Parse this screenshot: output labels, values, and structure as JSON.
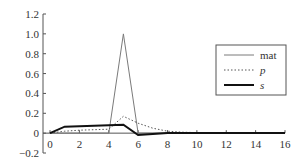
{
  "chart_data": {
    "type": "line",
    "title": "",
    "xlabel": "",
    "ylabel": "",
    "xlim": [
      0,
      16
    ],
    "ylim": [
      -0.2,
      1.2
    ],
    "grid": false,
    "legend_position": "upper right",
    "x_ticks": [
      0,
      2,
      4,
      6,
      8,
      10,
      12,
      14,
      16
    ],
    "x_tick_labels": [
      "0",
      "2",
      "4",
      "6",
      "8",
      "10",
      "12",
      "14",
      "16"
    ],
    "y_ticks": [
      -0.2,
      0,
      0.2,
      0.4,
      0.6,
      0.8,
      1.0,
      1.2
    ],
    "y_tick_labels": [
      "−0.2",
      "0",
      "0.2",
      "0.4",
      "0.6",
      "0.8",
      "1.0",
      "1.2"
    ],
    "x": [
      0,
      1,
      2,
      3,
      4,
      5,
      6,
      7,
      8,
      9,
      10,
      11,
      12,
      13,
      14,
      15,
      16
    ],
    "series": [
      {
        "name": "mat",
        "style": "solid-thin",
        "color": "#7a7a7a",
        "values": [
          0,
          0,
          0,
          0,
          0,
          1.0,
          0,
          0,
          0,
          0,
          0,
          0,
          0,
          0,
          0,
          0,
          0
        ]
      },
      {
        "name": "p",
        "style": "dotted",
        "color": "#555555",
        "values": [
          0,
          0.02,
          0.03,
          0.035,
          0.04,
          0.17,
          0.1,
          0.05,
          0.02,
          0.01,
          0.005,
          0,
          0,
          0,
          0,
          0,
          0
        ]
      },
      {
        "name": "s",
        "style": "solid-thick",
        "color": "#111111",
        "values": [
          0,
          0.065,
          0.07,
          0.075,
          0.08,
          0.085,
          -0.02,
          -0.01,
          0,
          0,
          0,
          0,
          0,
          0,
          0,
          0,
          0
        ]
      }
    ]
  }
}
